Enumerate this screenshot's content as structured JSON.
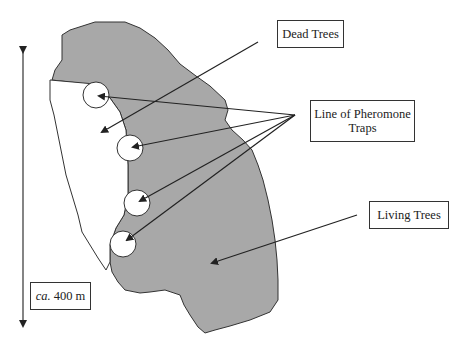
{
  "diagram": {
    "labels": {
      "dead_trees": "Dead Trees",
      "pheromone_line1": "Line of Pheromone",
      "pheromone_line2": "Traps",
      "living_trees": "Living Trees",
      "scale_prefix": "ca.",
      "scale_value": "400 m"
    },
    "colors": {
      "living_fill": "#a8a8a8",
      "dead_fill": "#ffffff",
      "outline": "#333333",
      "arrow": "#222222"
    },
    "traps": [
      {
        "cx": 96,
        "cy": 95,
        "r": 13
      },
      {
        "cx": 130,
        "cy": 148,
        "r": 13
      },
      {
        "cx": 137,
        "cy": 203,
        "r": 13
      },
      {
        "cx": 123,
        "cy": 244,
        "r": 13
      }
    ],
    "pheromone_origin": {
      "x": 295,
      "y": 115
    }
  }
}
